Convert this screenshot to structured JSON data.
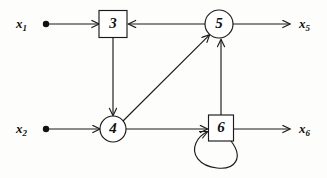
{
  "diagram": {
    "type": "signal-flow-graph",
    "title": "",
    "background_color": "#fdfdfc",
    "stroke_color": "#1a1a1a",
    "nodes": [
      {
        "id": "3",
        "label": "3",
        "shape": "square",
        "cx": 113,
        "cy": 24,
        "w": 28,
        "h": 27
      },
      {
        "id": "5",
        "label": "5",
        "shape": "circle",
        "cx": 219,
        "cy": 24,
        "r": 14
      },
      {
        "id": "4",
        "label": "4",
        "shape": "circle",
        "cx": 113,
        "cy": 129,
        "r": 13
      },
      {
        "id": "6",
        "label": "6",
        "shape": "square",
        "cx": 221,
        "cy": 128,
        "w": 25,
        "h": 26
      }
    ],
    "inputs": [
      {
        "id": "x1",
        "base": "x",
        "sub": "1",
        "label": "x1",
        "dot_x": 46,
        "dot_y": 24,
        "label_x": 16,
        "label_y": 16,
        "target": "3"
      },
      {
        "id": "x2",
        "base": "x",
        "sub": "2",
        "label": "x2",
        "dot_x": 46,
        "dot_y": 129,
        "label_x": 16,
        "label_y": 121,
        "target": "4"
      }
    ],
    "outputs": [
      {
        "id": "x5",
        "base": "x",
        "sub": "5",
        "label": "x5",
        "label_x": 299,
        "label_y": 16,
        "source": "5"
      },
      {
        "id": "x6",
        "base": "x",
        "sub": "6",
        "label": "x6",
        "label_x": 299,
        "label_y": 121,
        "source": "6"
      }
    ],
    "edges": [
      {
        "from": "x1",
        "to": "3",
        "kind": "horizontal-right"
      },
      {
        "from": "5",
        "to": "3",
        "kind": "horizontal-left"
      },
      {
        "from": "3",
        "to": "4",
        "kind": "vertical-down"
      },
      {
        "from": "x2",
        "to": "4",
        "kind": "horizontal-right"
      },
      {
        "from": "4",
        "to": "5",
        "kind": "diagonal-up-right"
      },
      {
        "from": "4",
        "to": "6",
        "kind": "horizontal-right"
      },
      {
        "from": "6",
        "to": "5",
        "kind": "vertical-up"
      },
      {
        "from": "6",
        "to": "6",
        "kind": "self-loop"
      },
      {
        "from": "5",
        "to": "x5",
        "kind": "horizontal-right"
      },
      {
        "from": "6",
        "to": "x6",
        "kind": "horizontal-right"
      }
    ]
  }
}
